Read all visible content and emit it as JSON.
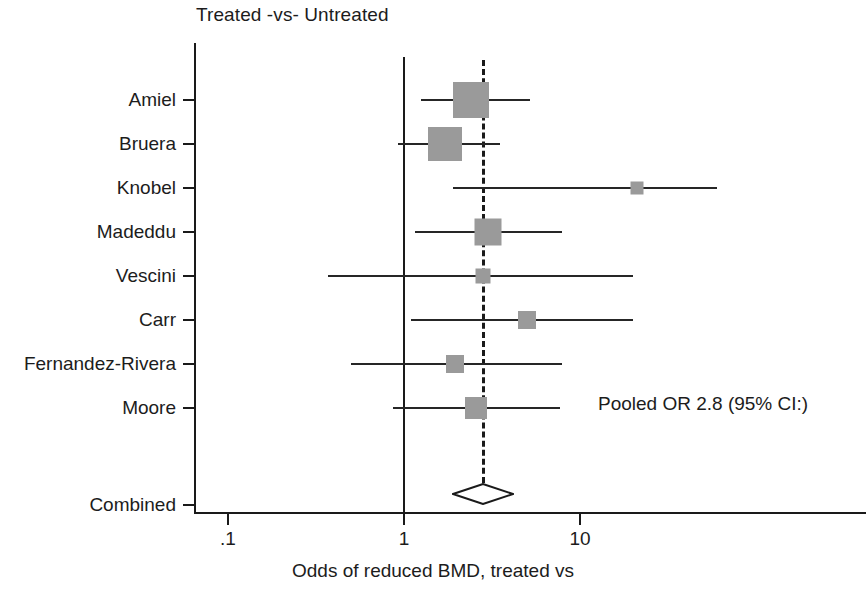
{
  "chart_data": {
    "type": "forest",
    "title": "Treated -vs- Untreated",
    "xlabel": "Odds of reduced BMD, treated vs",
    "ylabel": "",
    "xscale": "log",
    "xlim": [
      0.1,
      60
    ],
    "xticks": [
      0.1,
      1,
      10
    ],
    "xticklabels": [
      ".1",
      "1",
      "10"
    ],
    "grid": false,
    "null_line": 1,
    "pooled_line": 2.8,
    "annotation": "Pooled OR 2.8 (95% CI:)",
    "categories": [
      "Amiel",
      "Bruera",
      "Knobel",
      "Madeddu",
      "Vescini",
      "Carr",
      "Fernandez-Rivera",
      "Moore",
      "Combined"
    ],
    "studies": [
      {
        "label": "Amiel",
        "or": 2.4,
        "ci_low": 1.25,
        "ci_high": 5.2,
        "weight_px": 36
      },
      {
        "label": "Bruera",
        "or": 1.7,
        "ci_low": 0.93,
        "ci_high": 3.5,
        "weight_px": 34
      },
      {
        "label": "Knobel",
        "or": 21.0,
        "ci_low": 1.9,
        "ci_high": 60.0,
        "weight_px": 13
      },
      {
        "label": "Madeddu",
        "or": 3.0,
        "ci_low": 1.15,
        "ci_high": 7.9,
        "weight_px": 27
      },
      {
        "label": "Vescini",
        "or": 2.8,
        "ci_low": 0.37,
        "ci_high": 20.0,
        "weight_px": 15
      },
      {
        "label": "Carr",
        "or": 5.0,
        "ci_low": 1.1,
        "ci_high": 20.0,
        "weight_px": 18
      },
      {
        "label": "Fernandez-Rivera",
        "or": 1.95,
        "ci_low": 0.5,
        "ci_high": 7.9,
        "weight_px": 18
      },
      {
        "label": "Moore",
        "or": 2.55,
        "ci_low": 0.87,
        "ci_high": 7.7,
        "weight_px": 22
      }
    ],
    "combined": {
      "label": "Combined",
      "or": 2.8,
      "ci_low": 1.9,
      "ci_high": 4.2
    },
    "colors": {
      "box": "#9a9a9a",
      "line": "#262626",
      "axis": "#1a1a1a",
      "text": "#1c1c1c",
      "background": "#ffffff"
    }
  }
}
